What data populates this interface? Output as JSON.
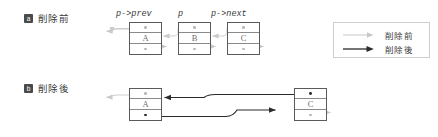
{
  "figure": {
    "background": "#ffffff",
    "colors": {
      "before_arrow": "#c9c9c9",
      "after_arrow": "#2b2b2b",
      "node_border": "#5a5a5a",
      "node_divider": "#8a8a8a",
      "badge_bg": "#4a4a4a",
      "badge_fg": "#ffffff",
      "text": "#3c3c3c",
      "letter": "#6e6e6e",
      "legend_border": "#cfcfcf"
    }
  },
  "panels": [
    {
      "id": "a",
      "badge": "a",
      "caption": "削除前",
      "pointer_labels": [
        {
          "name": "prev-pointer-label",
          "text": "p->prev"
        },
        {
          "name": "current-pointer-label",
          "text": "p"
        },
        {
          "name": "next-pointer-label",
          "text": "p->next"
        }
      ],
      "nodes": [
        {
          "name": "node-a",
          "letter": "A"
        },
        {
          "name": "node-b",
          "letter": "B"
        },
        {
          "name": "node-c",
          "letter": "C"
        }
      ]
    },
    {
      "id": "b",
      "badge": "b",
      "caption": "削除後",
      "nodes": [
        {
          "name": "node-a",
          "letter": "A"
        },
        {
          "name": "node-c",
          "letter": "C"
        }
      ]
    }
  ],
  "legend": {
    "items": [
      {
        "name": "legend-before",
        "label": "削除前",
        "style": "before"
      },
      {
        "name": "legend-after",
        "label": "削除後",
        "style": "after"
      }
    ]
  }
}
